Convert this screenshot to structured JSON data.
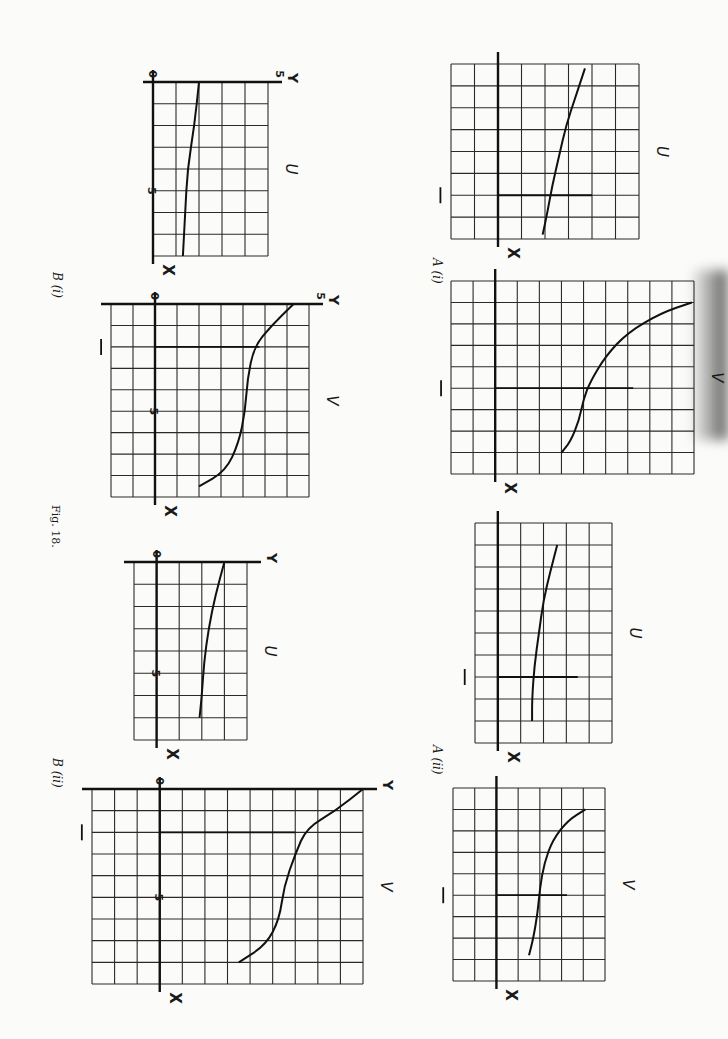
{
  "page": {
    "figure_caption": "Fig. 18.",
    "orientation_note": "page rotated 90 degrees clockwise"
  },
  "labels": {
    "A_i": "A (i)",
    "A_ii": "A (ii)",
    "B_i": "B (i)",
    "B_ii": "B (ii)"
  },
  "chart_data": [
    {
      "id": "A_i_U",
      "panel": "A (i)",
      "type": "line",
      "curve_label": "U",
      "axis_labels": {
        "x": "X",
        "y": ""
      },
      "marker": "—",
      "grid": {
        "cols": 8,
        "rows": 8
      },
      "box": [
        451,
        64,
        188,
        175
      ],
      "x_axis_pos": 2,
      "marker_row": 6,
      "curve": [
        [
          5.7,
          0.2
        ],
        [
          5.3,
          1.5
        ],
        [
          4.9,
          2.8
        ],
        [
          4.6,
          4.2
        ],
        [
          4.3,
          5.6
        ],
        [
          4.1,
          6.8
        ],
        [
          3.9,
          7.8
        ]
      ]
    },
    {
      "id": "A_i_V",
      "panel": "A (i)",
      "type": "line",
      "curve_label": "V",
      "axis_labels": {
        "x": "X",
        "y": ""
      },
      "marker": "—",
      "grid": {
        "cols": 11,
        "rows": 9
      },
      "box": [
        451,
        281,
        243,
        193
      ],
      "x_axis_pos": 2,
      "marker_row": 5,
      "curve": [
        [
          10.9,
          1.0
        ],
        [
          9.5,
          1.5
        ],
        [
          8.0,
          2.4
        ],
        [
          7.0,
          3.5
        ],
        [
          6.3,
          4.7
        ],
        [
          6.0,
          5.5
        ],
        [
          5.8,
          6.5
        ],
        [
          5.4,
          7.5
        ],
        [
          5.0,
          8.0
        ]
      ]
    },
    {
      "id": "A_ii_U",
      "panel": "A (ii)",
      "type": "line",
      "curve_label": "U",
      "axis_labels": {
        "x": "X",
        "y": ""
      },
      "marker": "—",
      "grid": {
        "cols": 6,
        "rows": 10
      },
      "box": [
        475,
        523,
        137,
        220
      ],
      "x_axis_pos": 1,
      "marker_row": 7,
      "curve": [
        [
          3.6,
          1.0
        ],
        [
          3.3,
          2.2
        ],
        [
          3.0,
          3.5
        ],
        [
          2.8,
          5.0
        ],
        [
          2.6,
          6.5
        ],
        [
          2.5,
          8.0
        ],
        [
          2.5,
          9.0
        ]
      ]
    },
    {
      "id": "A_ii_V",
      "panel": "A (ii)",
      "type": "line",
      "curve_label": "V",
      "axis_labels": {
        "x": "X",
        "y": ""
      },
      "marker": "—",
      "grid": {
        "cols": 7,
        "rows": 9
      },
      "box": [
        453,
        788,
        152,
        193
      ],
      "x_axis_pos": 2,
      "marker_row": 5,
      "curve": [
        [
          6.1,
          1.0
        ],
        [
          5.3,
          1.5
        ],
        [
          4.6,
          2.4
        ],
        [
          4.2,
          3.5
        ],
        [
          4.0,
          4.7
        ],
        [
          3.9,
          5.8
        ],
        [
          3.7,
          7.0
        ],
        [
          3.5,
          7.8
        ]
      ]
    },
    {
      "id": "B_i_U",
      "panel": "B (i)",
      "type": "line",
      "curve_label": "U",
      "axis_labels": {
        "x": "X",
        "y": "Y"
      },
      "ticks": {
        "origin": "0",
        "x5": "5",
        "y5": "5"
      },
      "grid": {
        "cols": 5,
        "rows": 8
      },
      "box": [
        153,
        82,
        115,
        174
      ],
      "x_axis_pos": 0,
      "curve": [
        [
          2.0,
          0.0
        ],
        [
          1.8,
          2.0
        ],
        [
          1.5,
          4.0
        ],
        [
          1.4,
          6.0
        ],
        [
          1.3,
          8.0
        ]
      ]
    },
    {
      "id": "B_i_V",
      "panel": "B (i)",
      "type": "line",
      "curve_label": "V",
      "axis_labels": {
        "x": "X",
        "y": "Y"
      },
      "ticks": {
        "origin": "0",
        "x5": "5",
        "y5": "5"
      },
      "marker": "—",
      "grid": {
        "cols": 9,
        "rows": 9
      },
      "box": [
        111,
        304,
        198,
        193
      ],
      "x_axis_pos": 2,
      "marker_row": 2,
      "curve": [
        [
          8.3,
          0.0
        ],
        [
          7.3,
          1.0
        ],
        [
          6.5,
          2.0
        ],
        [
          6.2,
          3.5
        ],
        [
          6.1,
          5.0
        ],
        [
          5.8,
          6.5
        ],
        [
          5.2,
          7.8
        ],
        [
          4.0,
          8.5
        ]
      ]
    },
    {
      "id": "B_ii_U",
      "panel": "B (ii)",
      "type": "line",
      "curve_label": "U",
      "axis_labels": {
        "x": "X",
        "y": "Y"
      },
      "ticks": {
        "origin": "0",
        "x5": "5"
      },
      "grid": {
        "cols": 5,
        "rows": 8
      },
      "box": [
        134,
        562,
        113,
        178
      ],
      "x_axis_pos": 1,
      "curve": [
        [
          4.0,
          0.0
        ],
        [
          3.6,
          1.5
        ],
        [
          3.3,
          3.0
        ],
        [
          3.1,
          4.5
        ],
        [
          3.0,
          6.0
        ],
        [
          2.9,
          7.0
        ]
      ]
    },
    {
      "id": "B_ii_V",
      "panel": "B (ii)",
      "type": "line",
      "curve_label": "V",
      "axis_labels": {
        "x": "X",
        "y": "Y"
      },
      "ticks": {
        "origin": "0",
        "x5": "5"
      },
      "marker": "—",
      "grid": {
        "cols": 12,
        "rows": 9
      },
      "box": [
        92,
        789,
        271,
        195
      ],
      "x_axis_pos": 3,
      "marker_row": 2,
      "curve": [
        [
          12.0,
          0.0
        ],
        [
          10.8,
          1.0
        ],
        [
          9.5,
          1.8
        ],
        [
          9.0,
          3.0
        ],
        [
          8.5,
          4.5
        ],
        [
          8.3,
          6.0
        ],
        [
          7.7,
          7.2
        ],
        [
          6.5,
          8.0
        ]
      ]
    }
  ]
}
